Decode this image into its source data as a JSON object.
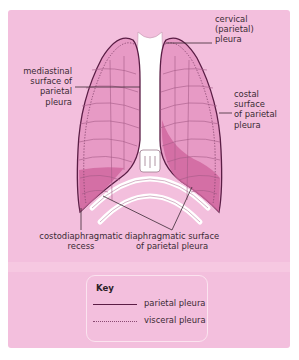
{
  "diagram": {
    "colors": {
      "background_panel": "#f3bfdd",
      "lung_fill": "#e79ac5",
      "lung_base_fill": "#d0679f",
      "parietal_line": "#5a1d45",
      "visceral_line": "#8a4a72",
      "bone": "#ffffff"
    },
    "labels": {
      "cervical": [
        "cervical",
        "(parietal)",
        "pleura"
      ],
      "mediastinal": [
        "mediastinal",
        "surface of",
        "parietal",
        "pleura"
      ],
      "costal": [
        "costal",
        "surface",
        "of parietal",
        "pleura"
      ],
      "costodiaphragmatic": [
        "costodiaphragmatic",
        "recess"
      ],
      "diaphragmatic": [
        "diaphragmatic surface",
        "of parietal pleura"
      ]
    },
    "key": {
      "title": "Key",
      "items": [
        {
          "style": "solid",
          "label": "parietal pleura"
        },
        {
          "style": "dotted",
          "label": "visceral pleura"
        }
      ]
    }
  }
}
